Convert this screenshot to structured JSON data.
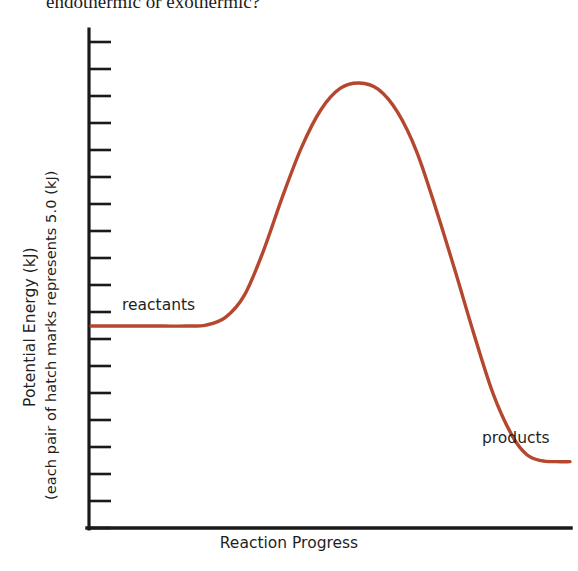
{
  "page": {
    "question_text": "endothermic or exothermic?",
    "background_color": "#ffffff"
  },
  "chart_data": {
    "type": "line",
    "title": "",
    "subtitle": "",
    "xlabel": "Reaction Progress",
    "ylabel": "Potential Energy (kJ)",
    "ylabel_note": "(each pair of hatch marks represents 5.0 (kJ)",
    "grid": false,
    "legend": "none",
    "curve_color": "#b5472e",
    "axis_color": "#1a1a1a",
    "xlim": [
      0,
      100
    ],
    "ylim": [
      0,
      100
    ],
    "x_ticks": [],
    "y_ticks": [],
    "y_hatch_mark_count": 19,
    "y_hatch_value_per_pair": 5.0,
    "annotations": [
      {
        "name": "reactants",
        "text": "reactants",
        "x": 12,
        "y": 43
      },
      {
        "name": "products",
        "text": "products",
        "x": 80,
        "y": 16
      }
    ],
    "series": [
      {
        "name": "reaction-energy-profile",
        "color": "#b5472e",
        "points": [
          {
            "x": 0,
            "y": 40.8
          },
          {
            "x": 5,
            "y": 40.8
          },
          {
            "x": 10,
            "y": 40.8
          },
          {
            "x": 15,
            "y": 40.8
          },
          {
            "x": 20,
            "y": 40.8
          },
          {
            "x": 24,
            "y": 41.0
          },
          {
            "x": 28,
            "y": 42.5
          },
          {
            "x": 32,
            "y": 47.0
          },
          {
            "x": 36,
            "y": 56.0
          },
          {
            "x": 40,
            "y": 67.0
          },
          {
            "x": 44,
            "y": 77.0
          },
          {
            "x": 48,
            "y": 84.5
          },
          {
            "x": 52,
            "y": 88.8
          },
          {
            "x": 56,
            "y": 89.9
          },
          {
            "x": 60,
            "y": 88.6
          },
          {
            "x": 64,
            "y": 84.0
          },
          {
            "x": 68,
            "y": 76.0
          },
          {
            "x": 72,
            "y": 64.5
          },
          {
            "x": 76,
            "y": 52.0
          },
          {
            "x": 80,
            "y": 39.0
          },
          {
            "x": 84,
            "y": 27.0
          },
          {
            "x": 88,
            "y": 18.5
          },
          {
            "x": 91,
            "y": 14.8
          },
          {
            "x": 94,
            "y": 13.6
          },
          {
            "x": 97,
            "y": 13.4
          },
          {
            "x": 100,
            "y": 13.4
          }
        ],
        "plateau_reactants_value": 40.8,
        "peak_value": 89.9,
        "plateau_products_value": 13.4
      }
    ]
  },
  "icons": {
    "y_axis_tick": "hatch-mark"
  }
}
